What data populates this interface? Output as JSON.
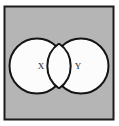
{
  "figure": {
    "type": "venn-two-set-overlapping"
  },
  "canvas": {
    "width": 119,
    "height": 126,
    "page_background": "#ffffff"
  },
  "frame": {
    "name": "outer-rectangle",
    "x": 4.5,
    "y": 6.5,
    "width": 109,
    "height": 113,
    "fill": "#b5b5b5",
    "stroke": "#1c1c1c",
    "stroke_width": 2
  },
  "sets": [
    {
      "id": "set-x",
      "label": "X",
      "cx": 37,
      "cy": 66,
      "r": 27.5,
      "fill": "#fcfcfc",
      "stroke": "#141414",
      "stroke_width": 2,
      "label_x": 41,
      "label_y": 66
    },
    {
      "id": "set-y",
      "label": "Y",
      "cx": 81,
      "cy": 66,
      "r": 27.5,
      "fill": "#fcfcfc",
      "stroke": "#141414",
      "stroke_width": 2,
      "label_x": 78,
      "label_y": 66
    }
  ],
  "intersection": {
    "id": "set-x-intersect-y",
    "label": "",
    "fill": "#fcfcfc",
    "stroke": "#141414"
  },
  "colors": {
    "background_gray": "#b5b5b5",
    "circle_fill": "#fcfcfc",
    "line": "#141414",
    "frame_line": "#1c1c1c",
    "label_text": "#1a1a1a"
  }
}
